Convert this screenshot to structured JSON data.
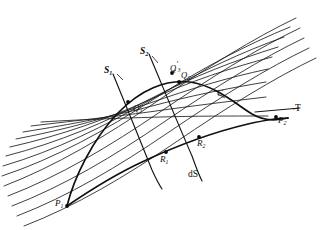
{
  "figure": {
    "domain_type": "geometric-diagram",
    "background_color": "#ffffff",
    "ink_color": "#0b0b0b"
  },
  "labels": {
    "s1": "S",
    "s1_sub": "1",
    "s2": "S",
    "s2_sub": "2",
    "q1": "Q",
    "q1_sub": "1",
    "q2": "Q",
    "q2_sub": "2",
    "q3": "Q",
    "q3_prime": "′",
    "q3_sub": "3",
    "r1": "R",
    "r1_sub": "1",
    "r2": "R",
    "r2_sub": "2",
    "p1": "P",
    "p1_sub": "1",
    "p2": "P",
    "p2_sub": "2",
    "curve_c": "C",
    "tangent_t": "T",
    "arc_element": "dS"
  },
  "elements": {
    "field_lines_count": 13,
    "extremal_curves": [
      {
        "name": "upper-extremal-C",
        "from": "P1",
        "through": [
          "Q1",
          "Q2"
        ],
        "to": "P2"
      },
      {
        "name": "lower-extremal",
        "from": "P1",
        "through": [
          "R1",
          "R2"
        ],
        "to": "P2"
      }
    ],
    "transversals": [
      {
        "name": "S1",
        "intersects": [
          "Q1",
          "R1"
        ]
      },
      {
        "name": "S2",
        "intersects": [
          "Q2",
          "Q3",
          "R2"
        ]
      }
    ],
    "marked_points": [
      "P1",
      "Q1",
      "Q2",
      "Q3",
      "R1",
      "R2",
      "P2"
    ],
    "tangent_line": "T"
  },
  "geometry": {
    "field_lines": [
      "M 8,196 C 60,176 110,146 160,112 C 210,78 258,48 300,28",
      "M 12,206 C 64,186 114,156 164,122 C 214,88 262,58 304,38",
      "M 17,216 C 69,196 119,166 169,132 C 219,98 267,68 309,48",
      "M 24,226 C 76,206 126,176 176,142 C 226,108 274,78 316,58",
      "M 4,186 C 56,166 106,136 156,102 C 206,68 254,38 296,18",
      "M 2,176 C 56,158 106,130 154,99 C 202,68 248,44 290,27",
      "M 3,166 C 57,150 105,126 152,99 C 199,72 242,52 284,37",
      "M 6,156 C 60,142 106,122 150,99 C 194,76 236,60 278,47",
      "M 10,147 C 63,135 107,119 149,100 C 191,81 230,68 272,57",
      "M 16,139 C 68,129 110,117 150,103 C 190,89 226,78 268,69",
      "M 23,132 C 74,124 114,116 152,106 C 190,96 224,89 266,82",
      "M 31,126 C 81,120 120,116 156,111 C 192,106 224,102 266,97",
      "M 41,122 C 90,119 127,118 161,117 C 195,116 226,116 268,116"
    ],
    "extremal_upper": "M 67,206 C 74,178 92,140 118,113 C 140,90 166,79 190,82 C 214,85 236,104 252,114 C 266,122 278,120 288,118",
    "extremal_lower": "M 67,206 C 86,193 112,176 142,162 C 176,146 214,132 248,124 C 266,120 280,118 288,118",
    "transversal_s1": "M 113,74 C 123,98 140,140 152,170 C 157,181 160,186 162,189",
    "transversal_s2": "M 149,54 C 160,80 178,124 192,156 C 197,170 200,177 202,181",
    "tangent": "M 255,112 L 300,108",
    "dots": [
      {
        "name": "P1",
        "x": 67,
        "y": 206
      },
      {
        "name": "Q1",
        "x": 128,
        "y": 102
      },
      {
        "name": "Q2",
        "x": 179,
        "y": 82
      },
      {
        "name": "Q3",
        "x": 172,
        "y": 73
      },
      {
        "name": "R1",
        "x": 166,
        "y": 152
      },
      {
        "name": "R2",
        "x": 199,
        "y": 137
      },
      {
        "name": "P2",
        "x": 276,
        "y": 117
      }
    ],
    "leaders": [
      {
        "name": "s1-leader",
        "d": "M 117,74 L 123,80"
      },
      {
        "name": "s2-leader",
        "d": "M 152,56 L 158,63"
      },
      {
        "name": "c-leader",
        "d": "M 218,94 L 225,98"
      },
      {
        "name": "t-leader",
        "d": "M 293,109 L 299,108"
      },
      {
        "name": "q3-leader",
        "d": "M 176,70 L 172,73"
      }
    ]
  }
}
